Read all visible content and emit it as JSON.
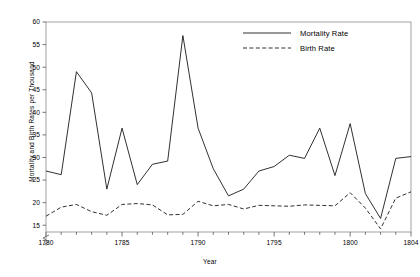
{
  "chart_data": {
    "type": "line",
    "title": "",
    "xlabel": "Year",
    "ylabel": "Mortality and Birth Rates per Thousand",
    "xlim": [
      1780,
      1804
    ],
    "ylim": [
      13.5,
      60
    ],
    "y_axis_break": true,
    "grid": false,
    "legend_position": "top-right",
    "x_ticks_major": [
      1780,
      1785,
      1790,
      1795,
      1800,
      1804
    ],
    "x_tick_labels": [
      "1780",
      "1785",
      "1790",
      "1795",
      "1800",
      "1804"
    ],
    "y_ticks": [
      15,
      20,
      25,
      30,
      35,
      40,
      45,
      50,
      55,
      60
    ],
    "y_tick_labels": [
      "15",
      "20",
      "25",
      "30",
      "35",
      "40",
      "45",
      "50",
      "55",
      "60"
    ],
    "x": [
      1780,
      1781,
      1782,
      1783,
      1784,
      1785,
      1786,
      1787,
      1788,
      1789,
      1790,
      1791,
      1792,
      1793,
      1794,
      1795,
      1796,
      1797,
      1798,
      1799,
      1800,
      1801,
      1802,
      1803,
      1804
    ],
    "series": [
      {
        "name": "Mortality Rate",
        "style": "solid",
        "color": "#1a1a1a",
        "values": [
          27.0,
          26.2,
          49.0,
          44.3,
          23.0,
          36.5,
          24.0,
          28.5,
          29.2,
          57.0,
          36.5,
          27.5,
          21.5,
          23.0,
          27.0,
          28.0,
          30.5,
          29.8,
          36.5,
          26.0,
          37.5,
          22.0,
          16.5,
          29.8,
          30.2
        ]
      },
      {
        "name": "Birth Rate",
        "style": "dashed",
        "color": "#1a1a1a",
        "values": [
          17.0,
          19.0,
          19.6,
          18.0,
          17.2,
          19.6,
          19.8,
          19.5,
          17.3,
          17.4,
          20.3,
          19.3,
          19.6,
          18.6,
          19.4,
          19.3,
          19.2,
          19.5,
          19.4,
          19.3,
          22.2,
          18.8,
          14.2,
          21.0,
          22.4
        ]
      }
    ]
  },
  "legend": {
    "items": [
      {
        "label": "Mortality Rate",
        "style": "solid"
      },
      {
        "label": "Birth Rate",
        "style": "dashed"
      }
    ]
  }
}
